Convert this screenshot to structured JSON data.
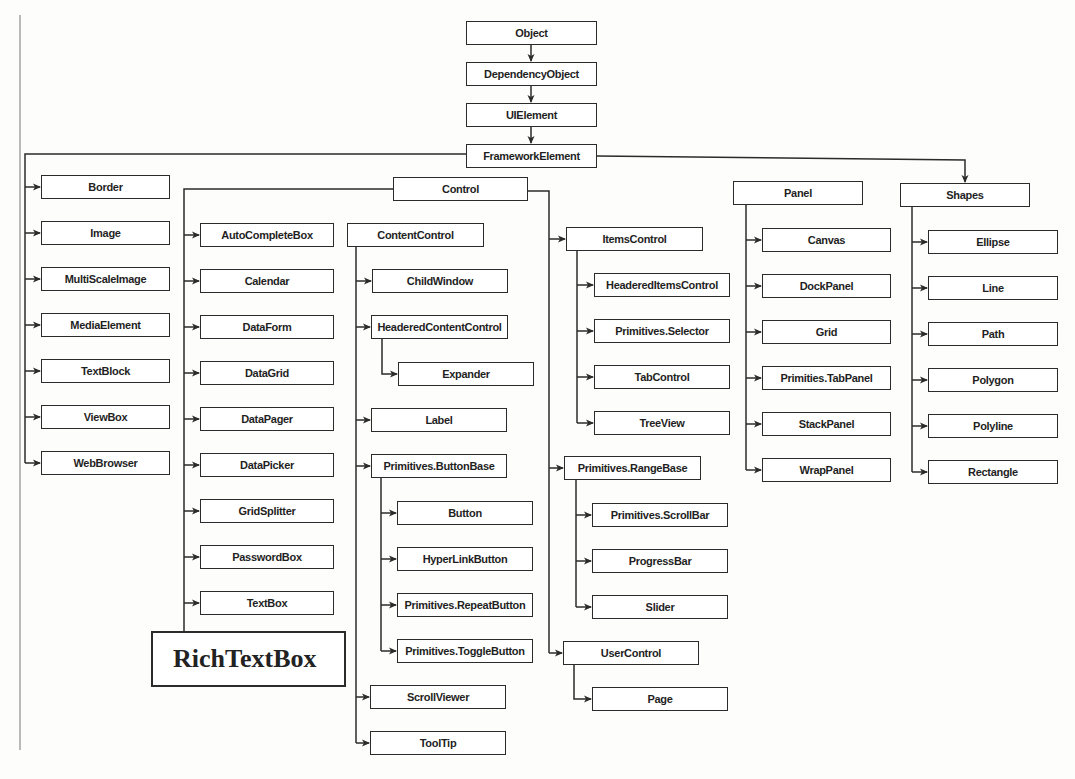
{
  "diagram": {
    "type": "class-hierarchy",
    "line_color": "#2b2b2b",
    "nodes": [
      {
        "id": "object",
        "label": "Object",
        "x": 466,
        "y": 21,
        "w": 131,
        "h": 24
      },
      {
        "id": "dependencyobject",
        "label": "DependencyObject",
        "x": 466,
        "y": 62,
        "w": 131,
        "h": 24
      },
      {
        "id": "uielement",
        "label": "UIElement",
        "x": 466,
        "y": 103,
        "w": 131,
        "h": 24
      },
      {
        "id": "frameworkelement",
        "label": "FrameworkElement",
        "x": 466,
        "y": 144,
        "w": 131,
        "h": 24
      },
      {
        "id": "border",
        "label": "Border",
        "x": 41,
        "y": 175,
        "w": 129,
        "h": 24
      },
      {
        "id": "image",
        "label": "Image",
        "x": 41,
        "y": 221,
        "w": 129,
        "h": 24
      },
      {
        "id": "multiscaleimage",
        "label": "MultiScaleImage",
        "x": 41,
        "y": 267,
        "w": 129,
        "h": 24
      },
      {
        "id": "mediaelement",
        "label": "MediaElement",
        "x": 41,
        "y": 313,
        "w": 129,
        "h": 24
      },
      {
        "id": "textblock",
        "label": "TextBlock",
        "x": 41,
        "y": 359,
        "w": 129,
        "h": 24
      },
      {
        "id": "viewbox",
        "label": "ViewBox",
        "x": 41,
        "y": 405,
        "w": 129,
        "h": 24
      },
      {
        "id": "webbrowser",
        "label": "WebBrowser",
        "x": 41,
        "y": 451,
        "w": 129,
        "h": 24
      },
      {
        "id": "control",
        "label": "Control",
        "x": 393,
        "y": 177,
        "w": 135,
        "h": 24
      },
      {
        "id": "autocompletebox",
        "label": "AutoCompleteBox",
        "x": 200,
        "y": 223,
        "w": 134,
        "h": 24
      },
      {
        "id": "calendar",
        "label": "Calendar",
        "x": 200,
        "y": 269,
        "w": 134,
        "h": 24
      },
      {
        "id": "dataform",
        "label": "DataForm",
        "x": 200,
        "y": 315,
        "w": 134,
        "h": 24
      },
      {
        "id": "datagrid",
        "label": "DataGrid",
        "x": 200,
        "y": 361,
        "w": 134,
        "h": 24
      },
      {
        "id": "datapager",
        "label": "DataPager",
        "x": 200,
        "y": 407,
        "w": 134,
        "h": 24
      },
      {
        "id": "datapicker",
        "label": "DataPicker",
        "x": 200,
        "y": 453,
        "w": 134,
        "h": 24
      },
      {
        "id": "gridsplitter",
        "label": "GridSplitter",
        "x": 200,
        "y": 499,
        "w": 134,
        "h": 24
      },
      {
        "id": "passwordbox",
        "label": "PasswordBox",
        "x": 200,
        "y": 545,
        "w": 134,
        "h": 24
      },
      {
        "id": "textbox",
        "label": "TextBox",
        "x": 200,
        "y": 591,
        "w": 134,
        "h": 24
      },
      {
        "id": "richtextbox",
        "label": "RichTextBox",
        "x": 151,
        "y": 631,
        "w": 195,
        "h": 56,
        "big": true
      },
      {
        "id": "contentcontrol",
        "label": "ContentControl",
        "x": 347,
        "y": 223,
        "w": 137,
        "h": 24
      },
      {
        "id": "childwindow",
        "label": "ChildWindow",
        "x": 372,
        "y": 269,
        "w": 136,
        "h": 24
      },
      {
        "id": "headeredcontentcontrol",
        "label": "HeaderedContentControl",
        "x": 371,
        "y": 315,
        "w": 137,
        "h": 24
      },
      {
        "id": "expander",
        "label": "Expander",
        "x": 398,
        "y": 362,
        "w": 136,
        "h": 24
      },
      {
        "id": "label",
        "label": "Label",
        "x": 371,
        "y": 408,
        "w": 136,
        "h": 24
      },
      {
        "id": "primitivesbuttonbase",
        "label": "Primitives.ButtonBase",
        "x": 371,
        "y": 454,
        "w": 136,
        "h": 24
      },
      {
        "id": "button",
        "label": "Button",
        "x": 397,
        "y": 501,
        "w": 136,
        "h": 24
      },
      {
        "id": "hyperlinkbutton",
        "label": "HyperLinkButton",
        "x": 397,
        "y": 547,
        "w": 136,
        "h": 24
      },
      {
        "id": "primitivesrepeatbutton",
        "label": "Primitives.RepeatButton",
        "x": 397,
        "y": 593,
        "w": 136,
        "h": 24
      },
      {
        "id": "primitivestogglebutton",
        "label": "Primitives.ToggleButton",
        "x": 397,
        "y": 639,
        "w": 136,
        "h": 24
      },
      {
        "id": "scrollviewer",
        "label": "ScrollViewer",
        "x": 370,
        "y": 685,
        "w": 136,
        "h": 24
      },
      {
        "id": "tooltip",
        "label": "ToolTip",
        "x": 370,
        "y": 731,
        "w": 136,
        "h": 24
      },
      {
        "id": "itemscontrol",
        "label": "ItemsControl",
        "x": 566,
        "y": 227,
        "w": 137,
        "h": 24
      },
      {
        "id": "headereditemscontrol",
        "label": "HeaderedItemsControl",
        "x": 594,
        "y": 273,
        "w": 136,
        "h": 24
      },
      {
        "id": "primitivesselector",
        "label": "Primitives.Selector",
        "x": 594,
        "y": 319,
        "w": 136,
        "h": 24
      },
      {
        "id": "tabcontrol",
        "label": "TabControl",
        "x": 594,
        "y": 365,
        "w": 136,
        "h": 24
      },
      {
        "id": "treeview",
        "label": "TreeView",
        "x": 594,
        "y": 411,
        "w": 136,
        "h": 24
      },
      {
        "id": "primitivesrangebase",
        "label": "Primitives.RangeBase",
        "x": 564,
        "y": 456,
        "w": 137,
        "h": 24
      },
      {
        "id": "primitivesscrollbar",
        "label": "Primitives.ScrollBar",
        "x": 592,
        "y": 503,
        "w": 136,
        "h": 24
      },
      {
        "id": "progressbar",
        "label": "ProgressBar",
        "x": 592,
        "y": 549,
        "w": 136,
        "h": 24
      },
      {
        "id": "slider",
        "label": "Slider",
        "x": 592,
        "y": 595,
        "w": 136,
        "h": 24
      },
      {
        "id": "usercontrol",
        "label": "UserControl",
        "x": 563,
        "y": 641,
        "w": 136,
        "h": 24
      },
      {
        "id": "page",
        "label": "Page",
        "x": 592,
        "y": 687,
        "w": 136,
        "h": 24
      },
      {
        "id": "panel",
        "label": "Panel",
        "x": 733,
        "y": 181,
        "w": 130,
        "h": 24
      },
      {
        "id": "canvas",
        "label": "Canvas",
        "x": 762,
        "y": 228,
        "w": 129,
        "h": 24
      },
      {
        "id": "dockpanel",
        "label": "DockPanel",
        "x": 762,
        "y": 274,
        "w": 129,
        "h": 24
      },
      {
        "id": "grid",
        "label": "Grid",
        "x": 762,
        "y": 320,
        "w": 129,
        "h": 24
      },
      {
        "id": "primitiestabpanel",
        "label": "Primities.TabPanel",
        "x": 762,
        "y": 366,
        "w": 129,
        "h": 24
      },
      {
        "id": "stackpanel",
        "label": "StackPanel",
        "x": 762,
        "y": 412,
        "w": 129,
        "h": 24
      },
      {
        "id": "wrappanel",
        "label": "WrapPanel",
        "x": 762,
        "y": 458,
        "w": 129,
        "h": 24
      },
      {
        "id": "shapes",
        "label": "Shapes",
        "x": 900,
        "y": 183,
        "w": 130,
        "h": 24
      },
      {
        "id": "ellipse",
        "label": "Ellipse",
        "x": 928,
        "y": 230,
        "w": 130,
        "h": 24
      },
      {
        "id": "line",
        "label": "Line",
        "x": 928,
        "y": 276,
        "w": 130,
        "h": 24
      },
      {
        "id": "path",
        "label": "Path",
        "x": 928,
        "y": 322,
        "w": 130,
        "h": 24
      },
      {
        "id": "polygon",
        "label": "Polygon",
        "x": 928,
        "y": 368,
        "w": 130,
        "h": 24
      },
      {
        "id": "polyline",
        "label": "Polyline",
        "x": 928,
        "y": 414,
        "w": 130,
        "h": 24
      },
      {
        "id": "rectangle",
        "label": "Rectangle",
        "x": 928,
        "y": 460,
        "w": 130,
        "h": 24
      }
    ],
    "edges": [
      {
        "from": "object",
        "to": "dependencyobject"
      },
      {
        "from": "dependencyobject",
        "to": "uielement"
      },
      {
        "from": "uielement",
        "to": "frameworkelement"
      },
      {
        "from": "frameworkelement",
        "to": "border"
      },
      {
        "from": "frameworkelement",
        "to": "image"
      },
      {
        "from": "frameworkelement",
        "to": "multiscaleimage"
      },
      {
        "from": "frameworkelement",
        "to": "mediaelement"
      },
      {
        "from": "frameworkelement",
        "to": "textblock"
      },
      {
        "from": "frameworkelement",
        "to": "viewbox"
      },
      {
        "from": "frameworkelement",
        "to": "webbrowser"
      },
      {
        "from": "frameworkelement",
        "to": "control"
      },
      {
        "from": "frameworkelement",
        "to": "panel"
      },
      {
        "from": "frameworkelement",
        "to": "shapes"
      },
      {
        "from": "control",
        "to": "autocompletebox"
      },
      {
        "from": "control",
        "to": "calendar"
      },
      {
        "from": "control",
        "to": "dataform"
      },
      {
        "from": "control",
        "to": "datagrid"
      },
      {
        "from": "control",
        "to": "datapager"
      },
      {
        "from": "control",
        "to": "datapicker"
      },
      {
        "from": "control",
        "to": "gridsplitter"
      },
      {
        "from": "control",
        "to": "passwordbox"
      },
      {
        "from": "control",
        "to": "textbox"
      },
      {
        "from": "control",
        "to": "richtextbox"
      },
      {
        "from": "control",
        "to": "contentcontrol"
      },
      {
        "from": "control",
        "to": "itemscontrol"
      },
      {
        "from": "control",
        "to": "primitivesrangebase"
      },
      {
        "from": "control",
        "to": "usercontrol"
      },
      {
        "from": "contentcontrol",
        "to": "childwindow"
      },
      {
        "from": "contentcontrol",
        "to": "headeredcontentcontrol"
      },
      {
        "from": "headeredcontentcontrol",
        "to": "expander"
      },
      {
        "from": "contentcontrol",
        "to": "label"
      },
      {
        "from": "contentcontrol",
        "to": "primitivesbuttonbase"
      },
      {
        "from": "primitivesbuttonbase",
        "to": "button"
      },
      {
        "from": "primitivesbuttonbase",
        "to": "hyperlinkbutton"
      },
      {
        "from": "primitivesbuttonbase",
        "to": "primitivesrepeatbutton"
      },
      {
        "from": "primitivesbuttonbase",
        "to": "primitivestogglebutton"
      },
      {
        "from": "contentcontrol",
        "to": "scrollviewer"
      },
      {
        "from": "contentcontrol",
        "to": "tooltip"
      },
      {
        "from": "itemscontrol",
        "to": "headereditemscontrol"
      },
      {
        "from": "itemscontrol",
        "to": "primitivesselector"
      },
      {
        "from": "itemscontrol",
        "to": "tabcontrol"
      },
      {
        "from": "itemscontrol",
        "to": "treeview"
      },
      {
        "from": "primitivesrangebase",
        "to": "primitivesscrollbar"
      },
      {
        "from": "primitivesrangebase",
        "to": "progressbar"
      },
      {
        "from": "primitivesrangebase",
        "to": "slider"
      },
      {
        "from": "usercontrol",
        "to": "page"
      },
      {
        "from": "panel",
        "to": "canvas"
      },
      {
        "from": "panel",
        "to": "dockpanel"
      },
      {
        "from": "panel",
        "to": "grid"
      },
      {
        "from": "panel",
        "to": "primitiestabpanel"
      },
      {
        "from": "panel",
        "to": "stackpanel"
      },
      {
        "from": "panel",
        "to": "wrappanel"
      },
      {
        "from": "shapes",
        "to": "ellipse"
      },
      {
        "from": "shapes",
        "to": "line"
      },
      {
        "from": "shapes",
        "to": "path"
      },
      {
        "from": "shapes",
        "to": "polygon"
      },
      {
        "from": "shapes",
        "to": "polyline"
      },
      {
        "from": "shapes",
        "to": "rectangle"
      }
    ]
  }
}
